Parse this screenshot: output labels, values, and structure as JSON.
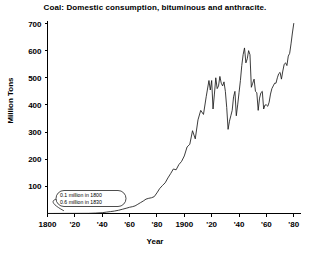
{
  "chart_data": {
    "type": "line",
    "title": "Coal: Domestic consumption, bituminous and anthracite.",
    "xlabel": "Year",
    "ylabel": "Million Tons",
    "xlim": [
      1800,
      1982
    ],
    "ylim": [
      0,
      730
    ],
    "grid": false,
    "legend": null,
    "y_ticks": [
      100,
      200,
      300,
      400,
      500,
      600,
      700
    ],
    "y_tick_labels": [
      "100",
      "200",
      "300",
      "400",
      "500",
      "600",
      "700"
    ],
    "x_ticks": [
      1800,
      1820,
      1840,
      1860,
      1880,
      1900,
      1920,
      1940,
      1960,
      1980
    ],
    "x_tick_labels": [
      "1800",
      "'20",
      "'40",
      "'60",
      "'80",
      "1900",
      "'20",
      "'40",
      "'60",
      "'80"
    ],
    "annotations": [
      {
        "name": "early-values-callout",
        "lines": [
          "0.1 million in 1800",
          "0.6 million in 1830"
        ],
        "points_to_year": 1812
      }
    ],
    "series": [
      {
        "name": "Domestic coal consumption",
        "x": [
          1800,
          1805,
          1810,
          1815,
          1820,
          1825,
          1830,
          1835,
          1840,
          1843,
          1846,
          1849,
          1852,
          1855,
          1858,
          1860,
          1862,
          1864,
          1866,
          1868,
          1870,
          1872,
          1874,
          1876,
          1878,
          1880,
          1882,
          1884,
          1886,
          1888,
          1890,
          1892,
          1894,
          1896,
          1898,
          1900,
          1902,
          1904,
          1906,
          1908,
          1910,
          1912,
          1914,
          1916,
          1918,
          1919,
          1920,
          1921,
          1922,
          1923,
          1924,
          1925,
          1926,
          1927,
          1928,
          1929,
          1930,
          1931,
          1932,
          1933,
          1934,
          1935,
          1936,
          1937,
          1938,
          1939,
          1940,
          1941,
          1942,
          1943,
          1944,
          1945,
          1946,
          1947,
          1948,
          1949,
          1950,
          1951,
          1952,
          1953,
          1954,
          1955,
          1956,
          1957,
          1958,
          1959,
          1960,
          1961,
          1962,
          1963,
          1964,
          1965,
          1966,
          1967,
          1968,
          1969,
          1970,
          1971,
          1972,
          1973,
          1974,
          1975,
          1976,
          1977,
          1978,
          1979,
          1980
        ],
        "values": [
          0.1,
          0.2,
          0.3,
          0.4,
          0.5,
          0.55,
          0.6,
          1.5,
          3,
          5,
          7,
          9,
          12,
          16,
          20,
          23,
          25,
          28,
          34,
          40,
          46,
          53,
          56,
          58,
          62,
          76,
          92,
          103,
          113,
          131,
          147,
          164,
          161,
          180,
          192,
          212,
          245,
          255,
          305,
          275,
          345,
          380,
          365,
          430,
          490,
          455,
          490,
          385,
          440,
          500,
          460,
          470,
          505,
          480,
          470,
          485,
          450,
          390,
          310,
          340,
          360,
          380,
          430,
          450,
          360,
          400,
          445,
          490,
          545,
          585,
          610,
          555,
          570,
          600,
          585,
          465,
          480,
          495,
          450,
          445,
          380,
          425,
          445,
          450,
          385,
          400,
          400,
          395,
          410,
          440,
          460,
          470,
          480,
          480,
          500,
          515,
          520,
          495,
          525,
          550,
          555,
          545,
          580,
          590,
          625,
          665,
          700
        ]
      }
    ]
  }
}
